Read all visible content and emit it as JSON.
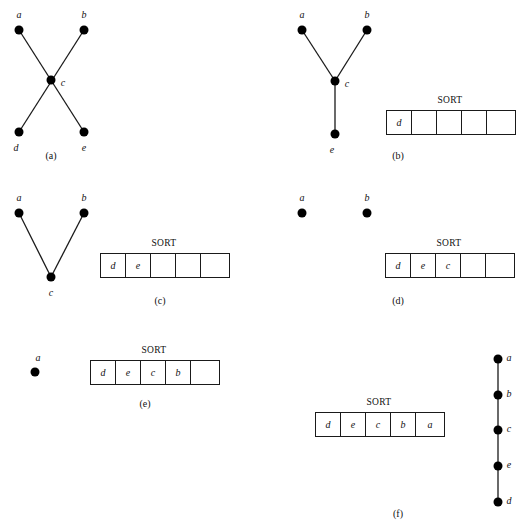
{
  "figure": {
    "sort_label": "SORT",
    "node_radius": 4.5,
    "edge_color": "#1a1a1a",
    "node_color": "#000000",
    "text_color": "#111111",
    "background": "#ffffff"
  },
  "panels": [
    {
      "id": "a",
      "caption": "(a)",
      "caption_x": 51,
      "caption_y": 150,
      "nodes": [
        {
          "label": "a",
          "x": 19,
          "y": 30,
          "lx": 19,
          "ly": 14
        },
        {
          "label": "b",
          "x": 84,
          "y": 30,
          "lx": 84,
          "ly": 14
        },
        {
          "label": "c",
          "x": 51,
          "y": 80,
          "lx": 63,
          "ly": 82
        },
        {
          "label": "d",
          "x": 19,
          "y": 132,
          "lx": 16,
          "ly": 147
        },
        {
          "label": "e",
          "x": 84,
          "y": 132,
          "lx": 84,
          "ly": 147
        }
      ],
      "edges": [
        {
          "from": "a",
          "to": "e"
        },
        {
          "from": "b",
          "to": "d"
        }
      ],
      "sort": null
    },
    {
      "id": "b",
      "caption": "(b)",
      "caption_x": 398,
      "caption_y": 150,
      "nodes": [
        {
          "label": "a",
          "x": 302,
          "y": 30,
          "lx": 302,
          "ly": 14
        },
        {
          "label": "b",
          "x": 367,
          "y": 30,
          "lx": 367,
          "ly": 14
        },
        {
          "label": "c",
          "x": 335,
          "y": 81,
          "lx": 347,
          "ly": 83
        },
        {
          "label": "e",
          "x": 335,
          "y": 134,
          "lx": 332,
          "ly": 149
        }
      ],
      "edges": [
        {
          "from": "a",
          "to": "c"
        },
        {
          "from": "b",
          "to": "c"
        },
        {
          "from": "c",
          "to": "e"
        }
      ],
      "sort": {
        "x": 386,
        "y": 110,
        "title_x": 64,
        "cells": [
          "d",
          "",
          "",
          "",
          ""
        ]
      }
    },
    {
      "id": "c",
      "caption": "(c)",
      "caption_x": 160,
      "caption_y": 295,
      "nodes": [
        {
          "label": "a",
          "x": 19,
          "y": 213,
          "lx": 19,
          "ly": 197
        },
        {
          "label": "b",
          "x": 84,
          "y": 213,
          "lx": 84,
          "ly": 197
        },
        {
          "label": "c",
          "x": 51,
          "y": 277,
          "lx": 51,
          "ly": 292
        }
      ],
      "edges": [
        {
          "from": "a",
          "to": "c"
        },
        {
          "from": "b",
          "to": "c"
        }
      ],
      "sort": {
        "x": 100,
        "y": 253,
        "title_x": 64,
        "cells": [
          "d",
          "e",
          "",
          "",
          ""
        ]
      }
    },
    {
      "id": "d",
      "caption": "(d)",
      "caption_x": 398,
      "caption_y": 295,
      "nodes": [
        {
          "label": "a",
          "x": 302,
          "y": 213,
          "lx": 302,
          "ly": 197
        },
        {
          "label": "b",
          "x": 367,
          "y": 213,
          "lx": 367,
          "ly": 197
        }
      ],
      "edges": [],
      "sort": {
        "x": 385,
        "y": 253,
        "title_x": 64,
        "cells": [
          "d",
          "e",
          "c",
          "",
          ""
        ]
      }
    },
    {
      "id": "e",
      "caption": "(e)",
      "caption_x": 145,
      "caption_y": 398,
      "nodes": [
        {
          "label": "a",
          "x": 35,
          "y": 372,
          "lx": 38,
          "ly": 357
        }
      ],
      "edges": [],
      "sort": {
        "x": 90,
        "y": 360,
        "title_x": 64,
        "cells": [
          "d",
          "e",
          "c",
          "b",
          ""
        ]
      }
    },
    {
      "id": "f",
      "caption": "(f)",
      "caption_x": 398,
      "caption_y": 508,
      "nodes": [
        {
          "label": "a",
          "x": 498,
          "y": 359,
          "lx": 509,
          "ly": 357
        },
        {
          "label": "b",
          "x": 498,
          "y": 395,
          "lx": 509,
          "ly": 393
        },
        {
          "label": "c",
          "x": 498,
          "y": 430,
          "lx": 509,
          "ly": 428
        },
        {
          "label": "e",
          "x": 498,
          "y": 466,
          "lx": 509,
          "ly": 464
        },
        {
          "label": "d",
          "x": 498,
          "y": 502,
          "lx": 509,
          "ly": 500
        }
      ],
      "edges": [
        {
          "from": "a",
          "to": "b"
        },
        {
          "from": "b",
          "to": "c"
        },
        {
          "from": "c",
          "to": "e"
        },
        {
          "from": "e",
          "to": "d"
        }
      ],
      "sort": {
        "x": 315,
        "y": 412,
        "title_x": 64,
        "cells": [
          "d",
          "e",
          "c",
          "b",
          "a"
        ]
      }
    }
  ]
}
